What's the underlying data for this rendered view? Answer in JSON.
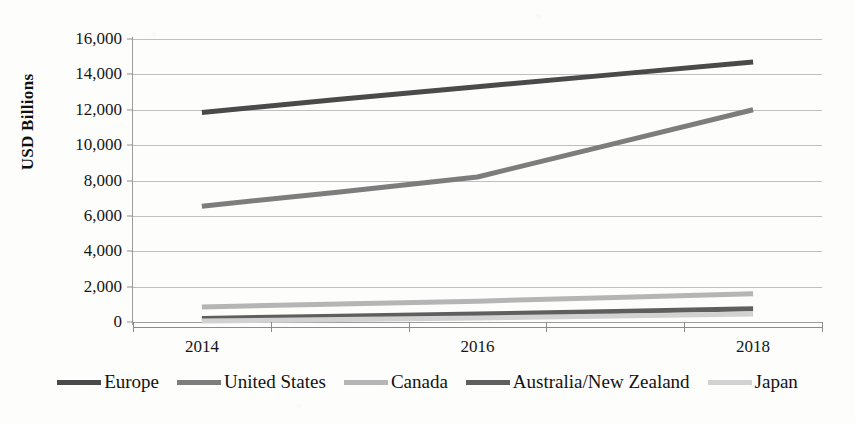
{
  "chart_data": {
    "type": "line",
    "title": "",
    "subtitle": "",
    "xlabel": "",
    "ylabel": "USD Billions",
    "x": [
      2014,
      2015,
      2016,
      2017,
      2018
    ],
    "x_tick_labels": [
      "2014",
      "2016",
      "2018"
    ],
    "x_tick_values": [
      2014,
      2016,
      2018
    ],
    "y_tick_labels": [
      "16,000",
      "14,000",
      "12,000",
      "10,000",
      "8,000",
      "6,000",
      "4,000",
      "2,000",
      "0"
    ],
    "y_tick_values": [
      16000,
      14000,
      12000,
      10000,
      8000,
      6000,
      4000,
      2000,
      0
    ],
    "ylim": [
      0,
      16000
    ],
    "xlim": [
      2013.5,
      2018.5
    ],
    "grid": "horizontal",
    "legend_position": "bottom",
    "series": [
      {
        "name": "Europe",
        "color": "#4a4a4a",
        "width": 5,
        "values": [
          11850,
          12600,
          13300,
          14000,
          14700
        ]
      },
      {
        "name": "United States",
        "color": "#7d7d7d",
        "width": 5,
        "values": [
          6550,
          7350,
          8200,
          10100,
          12000
        ]
      },
      {
        "name": "Canada",
        "color": "#b5b5b5",
        "width": 5,
        "values": [
          850,
          1020,
          1180,
          1380,
          1600
        ]
      },
      {
        "name": "Australia/New Zealand",
        "color": "#5f5f5f",
        "width": 5,
        "values": [
          200,
          330,
          450,
          600,
          750
        ]
      },
      {
        "name": "Japan",
        "color": "#d2d2d2",
        "width": 5,
        "values": [
          50,
          140,
          230,
          340,
          450
        ]
      }
    ]
  },
  "legend": {
    "items": [
      {
        "label": "Europe"
      },
      {
        "label": "United States"
      },
      {
        "label": "Canada"
      },
      {
        "label": "Australia/New Zealand"
      },
      {
        "label": "Japan"
      }
    ]
  }
}
